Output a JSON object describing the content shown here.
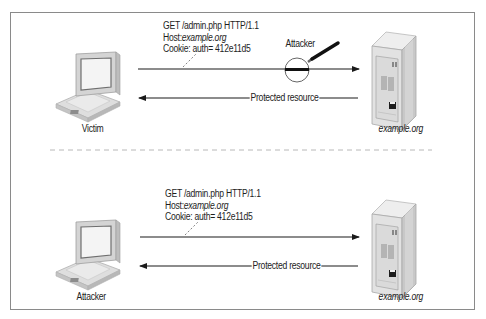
{
  "panels": [
    {
      "id": "top",
      "client_label": "Victim",
      "server_label": "example.org",
      "request": {
        "line1": "GET /admin.php HTTP/1.1",
        "host_key": "Host:",
        "host_value": "example.org",
        "cookie": "Cookie: auth= 412e11d5"
      },
      "response_label": "Protected resource",
      "interceptor_label": "Attacker"
    },
    {
      "id": "bottom",
      "client_label": "Attacker",
      "server_label": "example.org",
      "request": {
        "line1": "GET /admin.php HTTP/1.1",
        "host_key": "Host:",
        "host_value": "example.org",
        "cookie": "Cookie: auth= 412e11d5"
      },
      "response_label": "Protected resource"
    }
  ],
  "colors": {
    "line": "#1a1a1a",
    "border": "#8a8a8a",
    "divider": "#b8b8b8",
    "device_light": "#e6e6e6",
    "device_mid": "#cfcfcf",
    "device_dark": "#a8a8a8"
  }
}
